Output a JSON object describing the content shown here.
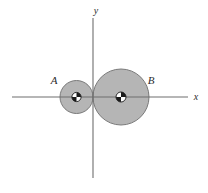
{
  "figure": {
    "caption": "",
    "background_color": "#ffffff",
    "width": 208,
    "height": 193
  },
  "axes": {
    "origin": {
      "x": 93,
      "y": 97
    },
    "line_color": "#6e6e6e",
    "line_width": 1.1,
    "x_axis": {
      "label": "x",
      "label_x": 196,
      "label_y": 100,
      "start_x": 12,
      "end_x": 188,
      "y": 97,
      "arrow": false
    },
    "y_axis": {
      "label": "y",
      "label_x": 96,
      "label_y": 14,
      "x": 93,
      "start_y": 18,
      "end_y": 178,
      "arrow": false
    }
  },
  "disks": [
    {
      "id": "disk-a",
      "label": "A",
      "label_x": 54,
      "label_y": 84,
      "center_x": 76.5,
      "center_y": 97,
      "radius": 16.5,
      "fill_color": "#b5b5b5",
      "stroke_color": "#7a7a7a",
      "stroke_width": 1.0,
      "center_marker": "center-of-mass",
      "marker_radius": 4.6
    },
    {
      "id": "disk-b",
      "label": "B",
      "label_x": 151,
      "label_y": 84,
      "center_x": 121,
      "center_y": 97,
      "radius": 28,
      "fill_color": "#b5b5b5",
      "stroke_color": "#7a7a7a",
      "stroke_width": 1.0,
      "center_marker": "center-of-mass",
      "marker_radius": 5.0
    }
  ],
  "markers": {
    "dark_color": "#1a1a1a",
    "light_color": "#ffffff",
    "ring_color": "#1a1a1a"
  }
}
